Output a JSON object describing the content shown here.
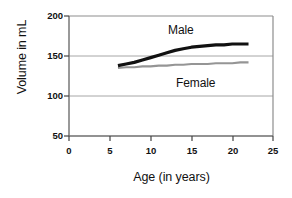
{
  "chart_data": {
    "type": "line",
    "title": "",
    "xlabel": "Age (in years)",
    "ylabel": "Volume in mL",
    "xlim": [
      0,
      25
    ],
    "ylim": [
      50,
      200
    ],
    "xticks": [
      "0",
      "5",
      "10",
      "15",
      "20",
      "25"
    ],
    "yticks": [
      "200",
      "150",
      "100",
      "50"
    ],
    "grid": "horizontal",
    "legend_position": "inline-annotations",
    "x": [
      6,
      7,
      8,
      9,
      10,
      11,
      12,
      13,
      14,
      15,
      16,
      17,
      18,
      19,
      20,
      21,
      22
    ],
    "series": [
      {
        "name": "Male",
        "color": "#111111",
        "values": [
          138,
          140,
          142,
          145,
          148,
          151,
          154,
          157,
          159,
          161,
          162,
          163,
          164,
          164,
          165,
          165,
          165
        ]
      },
      {
        "name": "Female",
        "color": "#959595",
        "values": [
          135,
          136,
          136,
          137,
          137,
          138,
          138,
          139,
          139,
          140,
          140,
          140,
          141,
          141,
          141,
          142,
          142
        ]
      }
    ],
    "annotations": [
      {
        "text": "Male",
        "x_px": 168,
        "y_px": 23
      },
      {
        "text": "Female",
        "x_px": 176,
        "y_px": 76
      }
    ]
  }
}
